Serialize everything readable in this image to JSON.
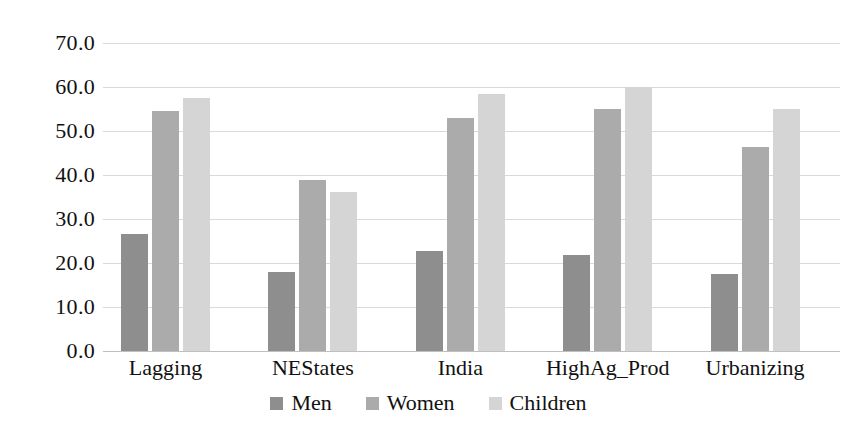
{
  "chart_data": {
    "type": "bar",
    "title": "",
    "subtitle": "",
    "xlabel": "",
    "ylabel": "",
    "categories": [
      "Lagging",
      "NEStates",
      "India",
      "HighAg_Prod",
      "Urbanizing"
    ],
    "series": [
      {
        "name": "Men",
        "color": "#8e8e8e",
        "values": [
          26.5,
          18.0,
          22.7,
          21.8,
          17.4
        ]
      },
      {
        "name": "Women",
        "color": "#ababab",
        "values": [
          54.5,
          38.8,
          53.0,
          55.0,
          46.4
        ]
      },
      {
        "name": "Children",
        "color": "#d5d5d5",
        "values": [
          57.5,
          36.2,
          58.3,
          60.0,
          55.0
        ]
      }
    ],
    "ylim": [
      0.0,
      70.0
    ],
    "ytick_step": 10.0,
    "ytick_labels": [
      "70.0",
      "60.0",
      "50.0",
      "40.0",
      "30.0",
      "20.0",
      "10.0",
      "0.0"
    ],
    "ytick_values": [
      70.0,
      60.0,
      50.0,
      40.0,
      30.0,
      20.0,
      10.0,
      0.0
    ],
    "grid": true,
    "grid_axis": "y",
    "legend_position": "bottom",
    "legend_entries": [
      "Men",
      "Women",
      "Children"
    ],
    "background_color": "#ffffff",
    "gridline_color": "#d9d9d9",
    "text_color": "#111111"
  }
}
